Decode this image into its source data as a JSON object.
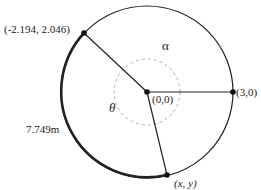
{
  "diagram": {
    "center_label": "(0,0)",
    "start_point_label": "(3,0)",
    "initial_point_label": "(-2.194, 2.046)",
    "end_point_label": "(x, y)",
    "arc_length_label": "7.749m",
    "angle_alpha_label": "α",
    "angle_theta_label": "θ",
    "colors": {
      "stroke": "#222222",
      "dashed_arc": "#b0b0b0",
      "background": "#ffffff"
    }
  }
}
